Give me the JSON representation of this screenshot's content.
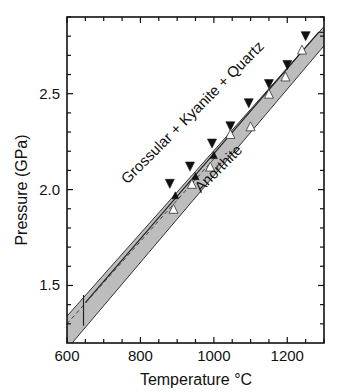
{
  "chart_data": {
    "type": "scatter",
    "title": "",
    "xlabel": "Temperature °C",
    "ylabel": "Pressure (GPa)",
    "xlim": [
      600,
      1300
    ],
    "ylim": [
      1.2,
      2.9
    ],
    "x_ticks": [
      600,
      800,
      1000,
      1200
    ],
    "x_tick_labels": [
      "600",
      "800",
      "1000",
      "1200"
    ],
    "x_minor_step": 50,
    "y_ticks": [
      1.5,
      2.0,
      2.5
    ],
    "y_tick_labels": [
      "1.5",
      "2.0",
      "2.5"
    ],
    "y_minor_step": 0.1,
    "grid": false,
    "annotations": [
      {
        "text": "Grossular + Kyanite + Quartz",
        "position": "above band",
        "rotation_deg": -45
      },
      {
        "text": "Anorthite",
        "position": "below band",
        "rotation_deg": -45
      }
    ],
    "band": {
      "description": "grey uncertainty band around reaction boundary",
      "upper_edge": [
        [
          600,
          1.34
        ],
        [
          1300,
          2.85
        ]
      ],
      "lower_edge": [
        [
          614,
          1.2
        ],
        [
          1300,
          2.75
        ]
      ],
      "center_solid": [
        [
          650,
          1.41
        ],
        [
          1285,
          2.82
        ]
      ],
      "center_dashed": [
        [
          600,
          1.3
        ],
        [
          1000,
          2.16
        ]
      ],
      "vertical_marker": {
        "x": 645,
        "y_range": [
          1.29,
          1.45
        ]
      }
    },
    "series": [
      {
        "name": "Grossular + Kyanite + Quartz grows (filled down-triangles)",
        "marker": "filled-down-triangle",
        "points": [
          [
            880,
            2.03
          ],
          [
            935,
            2.12
          ],
          [
            995,
            2.24
          ],
          [
            1045,
            2.33
          ],
          [
            1095,
            2.45
          ],
          [
            1150,
            2.55
          ],
          [
            1200,
            2.65
          ],
          [
            1250,
            2.8
          ]
        ]
      },
      {
        "name": "Reversal (small filled up-triangles)",
        "marker": "filled-up-triangle",
        "points": [
          [
            895,
            1.97
          ],
          [
            950,
            2.07
          ],
          [
            1000,
            2.18
          ]
        ]
      },
      {
        "name": "Anorthite grows (open up-triangles)",
        "marker": "open-up-triangle",
        "points": [
          [
            890,
            1.9
          ],
          [
            940,
            2.03
          ],
          [
            990,
            2.12
          ],
          [
            1045,
            2.29
          ],
          [
            1100,
            2.33
          ],
          [
            1150,
            2.5
          ],
          [
            1195,
            2.59
          ],
          [
            1240,
            2.73
          ]
        ]
      }
    ]
  }
}
